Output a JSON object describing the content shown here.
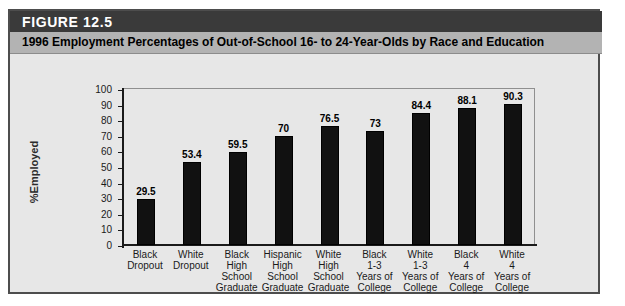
{
  "figure": {
    "number_label": "FIGURE 12.5",
    "title": "1996 Employment Percentages of Out-of-School 16- to 24-Year-Olds by Race and Education"
  },
  "colors": {
    "band_dark": "#3a3a3a",
    "band_gray": "#b3b3b3",
    "canvas": "#e7e7e7",
    "bar": "#111111",
    "border": "#4d4d4d"
  },
  "chart_data": {
    "type": "bar",
    "title": "1996 Employment Percentages of Out-of-School 16- to 24-Year-Olds by Race and Education",
    "xlabel": "",
    "ylabel": "%Employed",
    "ylim": [
      0,
      100
    ],
    "yticks": [
      100,
      90,
      80,
      70,
      60,
      50,
      40,
      30,
      20,
      10,
      0
    ],
    "ytick_labels": [
      "100",
      "90",
      "80",
      "70",
      "60",
      "50",
      "40",
      "30",
      "20",
      "10",
      "0"
    ],
    "grid": false,
    "legend": "none",
    "categories": [
      "Black Dropout",
      "White Dropout",
      "Black High School Graduate",
      "Hispanic High School Graduate",
      "White High School Graduate",
      "Black 1-3 Years of College",
      "White 1-3 Years of College",
      "Black 4 Years of College",
      "White 4 Years of College"
    ],
    "category_lines": [
      [
        "Black",
        "Dropout"
      ],
      [
        "White",
        "Dropout"
      ],
      [
        "Black High",
        "School",
        "Graduate"
      ],
      [
        "Hispanic",
        "High",
        "School",
        "Graduate"
      ],
      [
        "White",
        "High",
        "School",
        "Graduate"
      ],
      [
        "Black",
        "1-3",
        "Years of",
        "College"
      ],
      [
        "White",
        "1-3",
        "Years of",
        "College"
      ],
      [
        "Black",
        "4",
        "Years of",
        "College"
      ],
      [
        "White",
        "4",
        "Years of",
        "College"
      ]
    ],
    "values": [
      29.5,
      53.4,
      59.5,
      70,
      76.5,
      73,
      84.4,
      88.1,
      90.3
    ],
    "value_labels": [
      "29.5",
      "53.4",
      "59.5",
      "70",
      "76.5",
      "73",
      "84.4",
      "88.1",
      "90.3"
    ]
  }
}
